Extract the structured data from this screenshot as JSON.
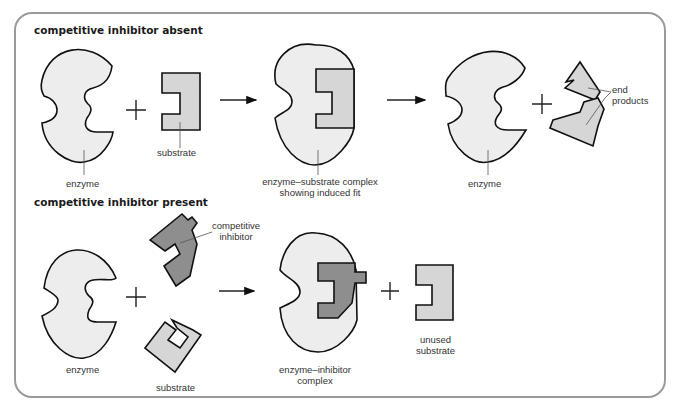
{
  "sections": [
    {
      "heading": "competitive inhibitor absent",
      "labels": {
        "enzyme": "enzyme",
        "substrate": "substrate",
        "complex_line1": "enzyme–substrate complex",
        "complex_line2": "showing induced fit",
        "enzyme_after": "enzyme",
        "end_products_line1": "end",
        "end_products_line2": "products"
      },
      "operators": [
        "+",
        "→",
        "→",
        "+"
      ]
    },
    {
      "heading": "competitive inhibitor present",
      "labels": {
        "enzyme": "enzyme",
        "competitive_inhibitor_line1": "competitive",
        "competitive_inhibitor_line2": "inhibitor",
        "substrate": "substrate",
        "complex_line1": "enzyme–inhibitor",
        "complex_line2": "complex",
        "unused_line1": "unused",
        "unused_line2": "substrate"
      },
      "operators": [
        "+",
        "→",
        "+"
      ]
    }
  ],
  "colors": {
    "enzyme_fill": "#ededed",
    "substrate_fill": "#d6d6d6",
    "inhibitor_fill": "#8e8e8e",
    "frame_border": "#9a9a9a"
  }
}
